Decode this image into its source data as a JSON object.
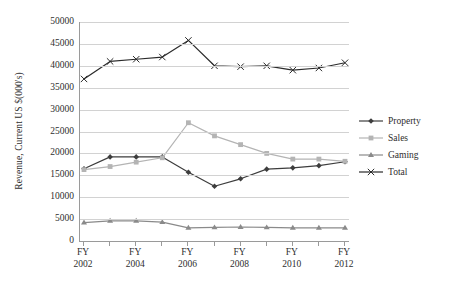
{
  "chart_data": {
    "type": "line",
    "title": "",
    "xlabel": "",
    "ylabel": "Revenue, Current US $(000's)",
    "ylim": [
      0,
      50000
    ],
    "ytick_values": [
      0,
      5000,
      10000,
      15000,
      20000,
      25000,
      30000,
      35000,
      40000,
      45000,
      50000
    ],
    "ytick_labels": [
      "0",
      "5000",
      "10000",
      "15000",
      "20000",
      "25000",
      "30000",
      "35000",
      "40000",
      "45000",
      "50000"
    ],
    "grid": true,
    "legend_position": "right",
    "x": [
      "FY 2002",
      "FY 2003",
      "FY 2004",
      "FY 2005",
      "FY 2006",
      "FY 2007",
      "FY 2008",
      "FY 2009",
      "FY 2010",
      "FY 2011",
      "FY 2012"
    ],
    "xtick_labels": [
      {
        "line1": "FY",
        "line2": "2002"
      },
      {
        "line1": "FY",
        "line2": "2004"
      },
      {
        "line1": "FY",
        "line2": "2006"
      },
      {
        "line1": "FY",
        "line2": "2008"
      },
      {
        "line1": "FY",
        "line2": "2010"
      },
      {
        "line1": "FY",
        "line2": "2012"
      }
    ],
    "xtick_indices": [
      0,
      2,
      4,
      6,
      8,
      10
    ],
    "series": [
      {
        "name": "Property",
        "color": "#3d3d3d",
        "marker": "diamond",
        "values": [
          16500,
          19200,
          19200,
          19200,
          15700,
          12500,
          14200,
          16400,
          16700,
          17200,
          18100
        ]
      },
      {
        "name": "Sales",
        "color": "#b4b4b4",
        "marker": "square",
        "values": [
          16300,
          17000,
          18000,
          19000,
          27000,
          24000,
          22000,
          20000,
          18700,
          18700,
          18200
        ]
      },
      {
        "name": "Gaming",
        "color": "#8a8a8a",
        "marker": "triangle",
        "values": [
          4200,
          4600,
          4600,
          4300,
          3000,
          3100,
          3200,
          3100,
          3000,
          3000,
          3000
        ]
      },
      {
        "name": "Total",
        "color": "#2b2b2b",
        "marker": "cross",
        "values": [
          37000,
          41000,
          41500,
          42000,
          45800,
          40000,
          39800,
          40000,
          39000,
          39500,
          40700
        ]
      }
    ]
  }
}
